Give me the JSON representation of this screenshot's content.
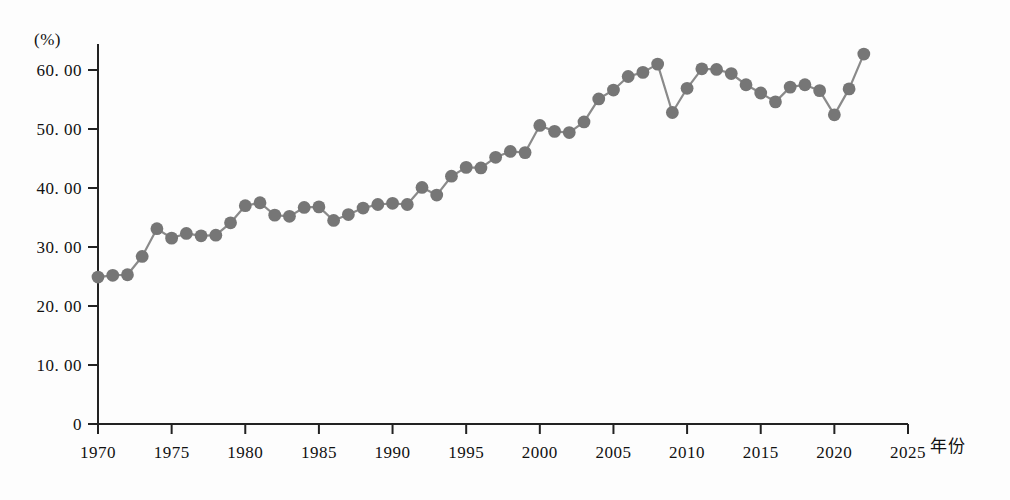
{
  "figure": {
    "y_axis_unit": "(%)",
    "x_axis_title": "年份",
    "caption": ""
  },
  "chart_data": {
    "type": "line",
    "title": "",
    "subtitle": "",
    "xlabel": "年份",
    "ylabel": "(%)",
    "xlim": [
      1970,
      2025
    ],
    "ylim": [
      0,
      65
    ],
    "grid": false,
    "legend": null,
    "marker": "circle",
    "marker_color": "#767676",
    "line_color": "#8a8a8a",
    "axis_color": "#222222",
    "x_ticks": [
      1970,
      1975,
      1980,
      1985,
      1990,
      1995,
      2000,
      2005,
      2010,
      2015,
      2020,
      2025
    ],
    "x_tick_labels": [
      "1970",
      "1975",
      "1980",
      "1985",
      "1990",
      "1995",
      "2000",
      "2005",
      "2010",
      "2015",
      "2020",
      "2025"
    ],
    "y_ticks": [
      0,
      10,
      20,
      30,
      40,
      50,
      60
    ],
    "y_tick_labels": [
      "0",
      "10. 00",
      "20. 00",
      "30. 00",
      "40. 00",
      "50. 00",
      "60. 00"
    ],
    "x": [
      1970,
      1971,
      1972,
      1973,
      1974,
      1975,
      1976,
      1977,
      1978,
      1979,
      1980,
      1981,
      1982,
      1983,
      1984,
      1985,
      1986,
      1987,
      1988,
      1989,
      1990,
      1991,
      1992,
      1993,
      1994,
      1995,
      1996,
      1997,
      1998,
      1999,
      2000,
      2001,
      2002,
      2003,
      2004,
      2005,
      2006,
      2007,
      2008,
      2009,
      2010,
      2011,
      2012,
      2013,
      2014,
      2015,
      2016,
      2017,
      2018,
      2019,
      2020,
      2021,
      2022
    ],
    "values": [
      24.9,
      25.2,
      25.3,
      28.4,
      33.1,
      31.5,
      32.3,
      31.9,
      32.0,
      34.1,
      37.0,
      37.5,
      35.4,
      35.2,
      36.7,
      36.8,
      34.5,
      35.5,
      36.6,
      37.2,
      37.4,
      37.2,
      40.1,
      38.8,
      42.0,
      43.5,
      43.4,
      45.2,
      46.2,
      46.0,
      50.6,
      49.6,
      49.4,
      51.2,
      55.1,
      56.6,
      58.9,
      59.6,
      61.0,
      52.8,
      56.9,
      60.2,
      60.1,
      59.4,
      57.5,
      56.1,
      54.6,
      57.1,
      57.5,
      56.5,
      52.4,
      56.8,
      62.7
    ],
    "series": [
      {
        "name": "比例",
        "values": [
          24.9,
          25.2,
          25.3,
          28.4,
          33.1,
          31.5,
          32.3,
          31.9,
          32.0,
          34.1,
          37.0,
          37.5,
          35.4,
          35.2,
          36.7,
          36.8,
          34.5,
          35.5,
          36.6,
          37.2,
          37.4,
          37.2,
          40.1,
          38.8,
          42.0,
          43.5,
          43.4,
          45.2,
          46.2,
          46.0,
          50.6,
          49.6,
          49.4,
          51.2,
          55.1,
          56.6,
          58.9,
          59.6,
          61.0,
          52.8,
          56.9,
          60.2,
          60.1,
          59.4,
          57.5,
          56.1,
          54.6,
          57.1,
          57.5,
          56.5,
          52.4,
          56.8,
          62.7
        ]
      }
    ]
  }
}
